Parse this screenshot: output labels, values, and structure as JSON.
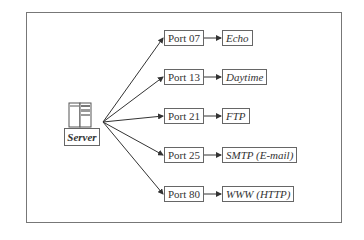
{
  "diagram": {
    "server": {
      "label": "Server"
    },
    "ports": [
      {
        "label": "Port 07",
        "service": "Echo"
      },
      {
        "label": "Port 13",
        "service": "Daytime"
      },
      {
        "label": "Port 21",
        "service": "FTP"
      },
      {
        "label": "Port 25",
        "service": "SMTP (E-mail)"
      },
      {
        "label": "Port 80",
        "service": "WWW (HTTP)"
      }
    ]
  }
}
